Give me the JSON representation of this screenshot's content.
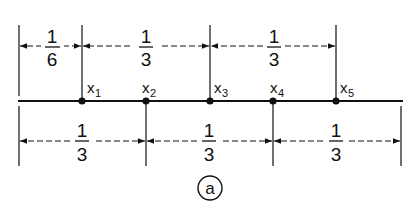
{
  "figure": {
    "label": "a",
    "main_line": {
      "x_start": 18,
      "x_end": 403,
      "y": 101
    },
    "points": [
      {
        "name": "x",
        "sub": "1",
        "x": 82
      },
      {
        "name": "x",
        "sub": "2",
        "x": 146
      },
      {
        "name": "x",
        "sub": "3",
        "x": 210
      },
      {
        "name": "x",
        "sub": "4",
        "x": 273
      },
      {
        "name": "x",
        "sub": "5",
        "x": 336
      }
    ],
    "top_dimensions": [
      {
        "num": "1",
        "den": "6",
        "x1": 19,
        "x2": 82
      },
      {
        "num": "1",
        "den": "3",
        "x1": 82,
        "x2": 210
      },
      {
        "num": "1",
        "den": "3",
        "x1": 210,
        "x2": 336
      }
    ],
    "bottom_dimensions": [
      {
        "num": "1",
        "den": "3",
        "x1": 19,
        "x2": 146
      },
      {
        "num": "1",
        "den": "3",
        "x1": 146,
        "x2": 273
      },
      {
        "num": "1",
        "den": "3",
        "x1": 273,
        "x2": 401
      }
    ],
    "line_color": "#111111"
  }
}
